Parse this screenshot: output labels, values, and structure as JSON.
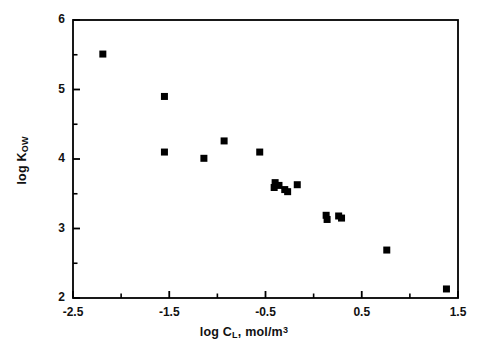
{
  "chart_data": {
    "type": "scatter",
    "title": "",
    "xlabel": "log C_L, mol/m^3",
    "ylabel": "log K_OW",
    "xlim": [
      -2.5,
      1.5
    ],
    "ylim": [
      2,
      6
    ],
    "xticks": [
      -2.5,
      -1.5,
      -0.5,
      0.5,
      1.5
    ],
    "xtick_labels": [
      "-2.5",
      "-1.5",
      "-0.5",
      "0.5",
      "1.5"
    ],
    "xminor_ticks": [
      -2.0,
      -1.0,
      0.0,
      1.0
    ],
    "yticks": [
      2,
      3,
      4,
      5,
      6
    ],
    "ytick_labels": [
      "2",
      "3",
      "4",
      "5",
      "6"
    ],
    "yminor_ticks": [
      2.5,
      3.5,
      4.5,
      5.5
    ],
    "grid": false,
    "legend": null,
    "marker": "square",
    "marker_color": "#000000",
    "marker_size": 7,
    "series": [
      {
        "name": "compounds",
        "points": [
          {
            "x": -2.19,
            "y": 5.51
          },
          {
            "x": -1.55,
            "y": 4.9
          },
          {
            "x": -1.55,
            "y": 4.1
          },
          {
            "x": -1.14,
            "y": 4.01
          },
          {
            "x": -0.93,
            "y": 4.26
          },
          {
            "x": -0.56,
            "y": 4.1
          },
          {
            "x": -0.4,
            "y": 3.66
          },
          {
            "x": -0.41,
            "y": 3.59
          },
          {
            "x": -0.36,
            "y": 3.62
          },
          {
            "x": -0.3,
            "y": 3.56
          },
          {
            "x": -0.27,
            "y": 3.53
          },
          {
            "x": -0.17,
            "y": 3.63
          },
          {
            "x": 0.13,
            "y": 3.19
          },
          {
            "x": 0.14,
            "y": 3.13
          },
          {
            "x": 0.26,
            "y": 3.18
          },
          {
            "x": 0.29,
            "y": 3.15
          },
          {
            "x": 0.76,
            "y": 2.69
          },
          {
            "x": 1.38,
            "y": 2.13
          }
        ]
      }
    ]
  },
  "axis_labels": {
    "x_prefix": "log C",
    "x_sub": "L",
    "x_mid": ", mol/m",
    "x_sup": "3",
    "y_prefix": "log K",
    "y_sub": "OW"
  },
  "style": {
    "frame_color": "#000000",
    "background": "#ffffff",
    "text_color": "#111111"
  }
}
